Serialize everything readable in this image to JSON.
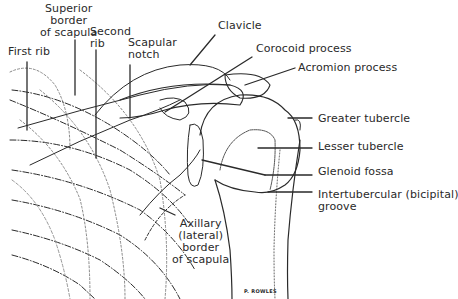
{
  "diagram": {
    "colors": {
      "ink": "#2a2a2a",
      "background": "#ffffff"
    },
    "labels": {
      "superior_border": [
        "Superior",
        "border",
        "of scapula"
      ],
      "first_rib": "First rib",
      "second_rib": [
        "Second",
        "rib"
      ],
      "scapular_notch": [
        "Scapular",
        "notch"
      ],
      "clavicle": "Clavicle",
      "coracoid": "Corocoid process",
      "acromion": "Acromion process",
      "greater_tubercle": "Greater tubercle",
      "lesser_tubercle": "Lesser tubercle",
      "glenoid_fossa": "Glenoid fossa",
      "intertubercular": [
        "Intertubercular (bicipital)",
        "groove"
      ],
      "axillary_border": [
        "Axillary",
        "(lateral)",
        "border",
        "of scapula"
      ],
      "signature": "P. ROWLES"
    }
  }
}
